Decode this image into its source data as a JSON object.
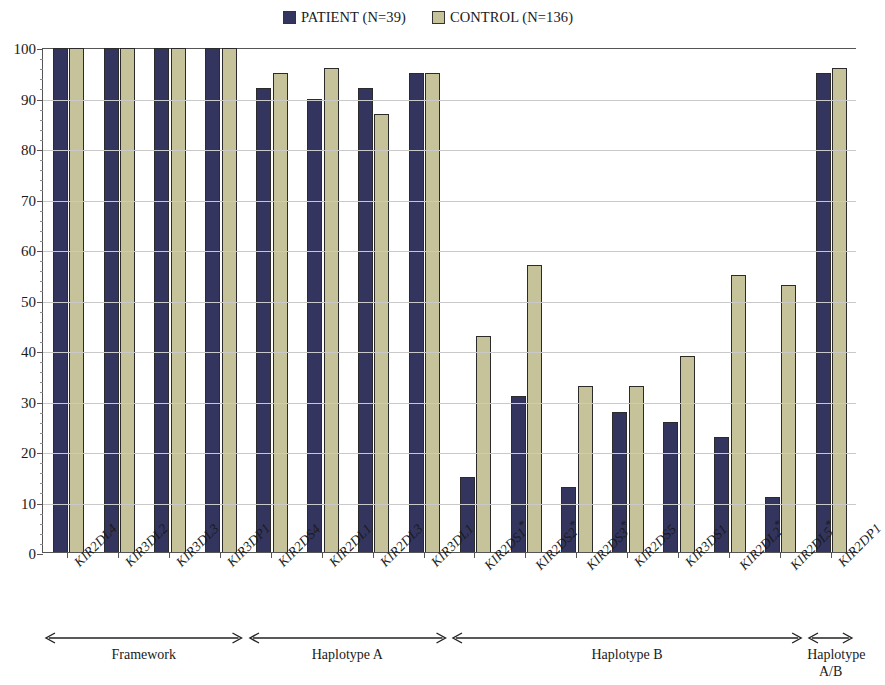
{
  "legend": {
    "entries": [
      {
        "label": "PATIENT (N=39)",
        "color": "#33355e",
        "key": "patient"
      },
      {
        "label": "CONTROL (N=136)",
        "color": "#c6c29a",
        "key": "control"
      }
    ]
  },
  "axis": {
    "y_ticks": [
      "0",
      "10",
      "20",
      "30",
      "40",
      "50",
      "60",
      "70",
      "80",
      "90",
      "100"
    ]
  },
  "groups": [
    {
      "name": "Framework",
      "start": 0,
      "end": 4
    },
    {
      "name": "Haplotype A",
      "start": 4,
      "end": 8
    },
    {
      "name": "Haplotype B",
      "start": 8,
      "end": 15
    },
    {
      "name": "Haplotype\nA/B",
      "start": 15,
      "end": 16
    }
  ],
  "chart_data": {
    "type": "bar",
    "title": "",
    "xlabel": "",
    "ylabel": "",
    "ylim": [
      0,
      100
    ],
    "ytick_step": 10,
    "grid": true,
    "legend_position": "top-center",
    "categories": [
      "KIR2DL4",
      "KIR3DL2",
      "KIR3DL3",
      "KIR3DP1",
      "KIR2DS4",
      "KIR2DL1",
      "KIR2DL3",
      "KIR3DL1",
      "KIR2DS1*",
      "KIR2DS2*",
      "KIR2DS3*",
      "KIR2DS5",
      "KIR3DS1",
      "KIR2DL2*",
      "KIR2DL5*",
      "KIR2DP1"
    ],
    "significant": [
      false,
      false,
      false,
      false,
      false,
      false,
      false,
      false,
      true,
      true,
      true,
      false,
      false,
      true,
      true,
      false
    ],
    "series": [
      {
        "name": "PATIENT (N=39)",
        "color": "#33355e",
        "values": [
          100,
          100,
          100,
          100,
          92,
          90,
          92,
          95,
          15,
          31,
          13,
          28,
          26,
          23,
          11,
          95
        ]
      },
      {
        "name": "CONTROL (N=136)",
        "color": "#c6c29a",
        "values": [
          100,
          100,
          100,
          100,
          95,
          96,
          87,
          95,
          43,
          57,
          33,
          33,
          39,
          55,
          53,
          96
        ]
      }
    ]
  }
}
